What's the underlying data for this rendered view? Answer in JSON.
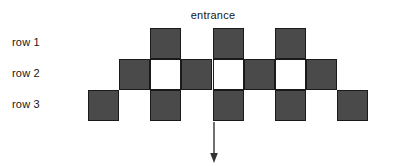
{
  "diagram": {
    "title": "entrance",
    "row_labels": [
      "row 1",
      "row 2",
      "row 3"
    ],
    "colors": {
      "dark_cell": "#4a4a4a",
      "light_cell": "#ffffff",
      "cell_border": "#1a1a1a",
      "text": "#161616",
      "arrow": "#333333",
      "background": "#ffffff"
    },
    "geometry": {
      "cell_size_px": 31,
      "column_x": [
        88,
        119,
        150,
        181,
        213,
        244,
        275,
        306,
        337
      ],
      "row_y": [
        28,
        59,
        90
      ]
    },
    "rows": [
      {
        "label": "row 1",
        "y": 28,
        "cells": [
          {
            "x": 150,
            "fill": "dark"
          },
          {
            "x": 213,
            "fill": "dark"
          },
          {
            "x": 275,
            "fill": "dark"
          }
        ]
      },
      {
        "label": "row 2",
        "y": 59,
        "cells": [
          {
            "x": 119,
            "fill": "dark"
          },
          {
            "x": 150,
            "fill": "light"
          },
          {
            "x": 181,
            "fill": "dark"
          },
          {
            "x": 213,
            "fill": "light"
          },
          {
            "x": 244,
            "fill": "dark"
          },
          {
            "x": 275,
            "fill": "light"
          },
          {
            "x": 306,
            "fill": "dark"
          }
        ]
      },
      {
        "label": "row 3",
        "y": 90,
        "cells": [
          {
            "x": 88,
            "fill": "dark"
          },
          {
            "x": 150,
            "fill": "dark"
          },
          {
            "x": 213,
            "fill": "dark"
          },
          {
            "x": 275,
            "fill": "dark"
          },
          {
            "x": 337,
            "fill": "dark"
          }
        ]
      }
    ],
    "arrow": {
      "name": "down-arrow",
      "x": 213,
      "y_start": 122,
      "y_end": 162,
      "direction": "down"
    }
  }
}
